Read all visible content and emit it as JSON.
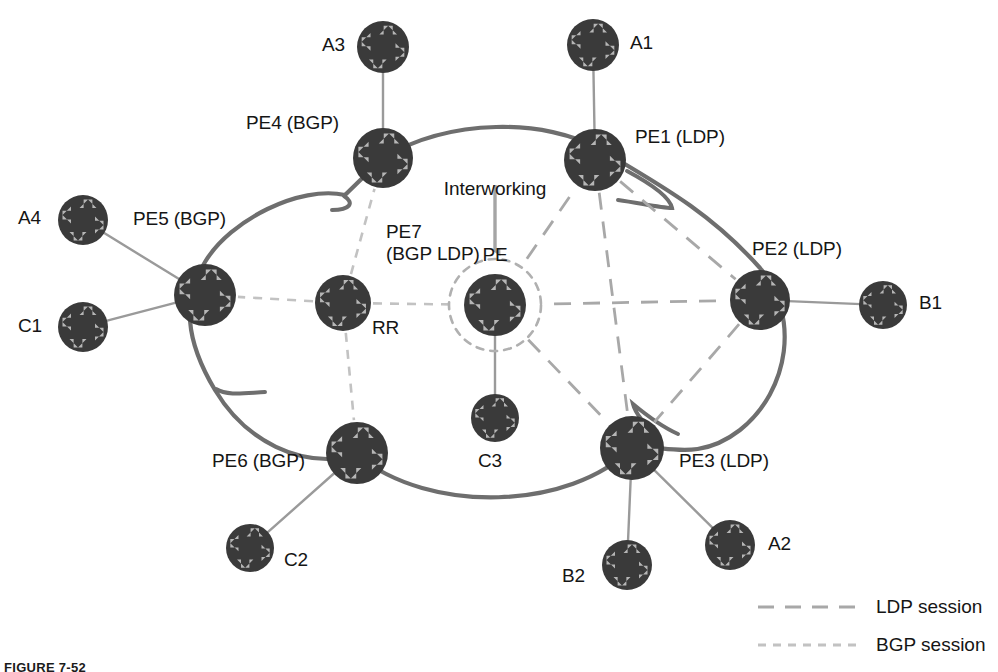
{
  "figure": {
    "type": "network-topology-diagram",
    "caption": "FIGURE 7-52",
    "background_color": "#ffffff",
    "node_fill_color": "#3a3a3a",
    "node_arrow_color": "#b6b6b6",
    "cloud_stroke_color": "#6e6e6e",
    "access_link_color": "#9a9a9a",
    "ldp_session_color": "#a8a8a8",
    "bgp_session_color": "#c2c2c2",
    "interworking_circle_color": "#b0b0b0",
    "arrow_annotation_color": "#a5a5a5"
  },
  "annotation": {
    "interworking_line1": "Interworking",
    "interworking_line2": "PE",
    "arrow_icon": "down-arrow-icon"
  },
  "legend": {
    "items": [
      {
        "id": "ldp",
        "label": "LDP session",
        "style": "long-dash",
        "color": "#a8a8a8"
      },
      {
        "id": "bgp",
        "label": "BGP session",
        "style": "short-dash",
        "color": "#c2c2c2"
      }
    ]
  },
  "nodes": [
    {
      "id": "A3",
      "label": "A3",
      "x": 383,
      "y": 47,
      "r": 26,
      "label_x": 322,
      "label_y": 34,
      "align": "left",
      "role": "ce"
    },
    {
      "id": "A1",
      "label": "A1",
      "x": 593,
      "y": 45,
      "r": 26,
      "label_x": 630,
      "label_y": 32,
      "align": "left",
      "role": "ce"
    },
    {
      "id": "PE4",
      "label": "PE4 (BGP)",
      "x": 383,
      "y": 158,
      "r": 30,
      "label_x": 246,
      "label_y": 112,
      "align": "left",
      "role": "pe-bgp"
    },
    {
      "id": "PE1",
      "label": "PE1 (LDP)",
      "x": 595,
      "y": 160,
      "r": 31,
      "label_x": 635,
      "label_y": 126,
      "align": "left",
      "role": "pe-ldp"
    },
    {
      "id": "A4",
      "label": "A4",
      "x": 83,
      "y": 220,
      "r": 25,
      "label_x": 18,
      "label_y": 207,
      "align": "left",
      "role": "ce"
    },
    {
      "id": "PE5",
      "label": "PE5 (BGP)",
      "x": 205,
      "y": 295,
      "r": 31,
      "label_x": 133,
      "label_y": 208,
      "align": "left",
      "role": "pe-bgp"
    },
    {
      "id": "PE2",
      "label": "PE2 (LDP)",
      "x": 760,
      "y": 300,
      "r": 30,
      "label_x": 752,
      "label_y": 238,
      "align": "left",
      "role": "pe-ldp"
    },
    {
      "id": "B1",
      "label": "B1",
      "x": 883,
      "y": 305,
      "r": 24,
      "label_x": 919,
      "label_y": 292,
      "align": "left",
      "role": "ce"
    },
    {
      "id": "RR",
      "label": "RR",
      "x": 343,
      "y": 303,
      "r": 28,
      "label_x": 372,
      "label_y": 317,
      "align": "left",
      "role": "rr"
    },
    {
      "id": "PE7",
      "label": "PE7\n(BGP LDP)",
      "x": 495,
      "y": 305,
      "r": 31,
      "label_x": 386,
      "label_y": 221,
      "align": "left",
      "role": "pe-interworking"
    },
    {
      "id": "C1",
      "label": "C1",
      "x": 83,
      "y": 327,
      "r": 25,
      "label_x": 18,
      "label_y": 315,
      "align": "left",
      "role": "ce"
    },
    {
      "id": "C3",
      "label": "C3",
      "x": 495,
      "y": 418,
      "r": 24,
      "label_x": 478,
      "label_y": 450,
      "align": "left",
      "role": "ce"
    },
    {
      "id": "PE6",
      "label": "PE6 (BGP)",
      "x": 357,
      "y": 453,
      "r": 31,
      "label_x": 212,
      "label_y": 450,
      "align": "left",
      "role": "pe-bgp"
    },
    {
      "id": "PE3",
      "label": "PE3 (LDP)",
      "x": 632,
      "y": 448,
      "r": 32,
      "label_x": 679,
      "label_y": 450,
      "align": "left",
      "role": "pe-ldp"
    },
    {
      "id": "C2",
      "label": "C2",
      "x": 250,
      "y": 548,
      "r": 24,
      "label_x": 284,
      "label_y": 549,
      "align": "left",
      "role": "ce"
    },
    {
      "id": "B2",
      "label": "B2",
      "x": 627,
      "y": 565,
      "r": 25,
      "label_x": 562,
      "label_y": 565,
      "align": "left",
      "role": "ce"
    },
    {
      "id": "A2",
      "label": "A2",
      "x": 730,
      "y": 545,
      "r": 25,
      "label_x": 768,
      "label_y": 533,
      "align": "left",
      "role": "ce"
    }
  ],
  "access_links": [
    {
      "from": "A3",
      "to": "PE4"
    },
    {
      "from": "A1",
      "to": "PE1"
    },
    {
      "from": "A4",
      "to": "PE5"
    },
    {
      "from": "C1",
      "to": "PE5"
    },
    {
      "from": "PE2",
      "to": "B1"
    },
    {
      "from": "PE7",
      "to": "C3"
    },
    {
      "from": "PE6",
      "to": "C2"
    },
    {
      "from": "PE3",
      "to": "B2"
    },
    {
      "from": "PE3",
      "to": "A2"
    }
  ],
  "ldp_sessions": [
    {
      "from": "PE1",
      "to": "PE2"
    },
    {
      "from": "PE1",
      "to": "PE3"
    },
    {
      "from": "PE1",
      "to": "PE7"
    },
    {
      "from": "PE2",
      "to": "PE3"
    },
    {
      "from": "PE2",
      "to": "PE7"
    },
    {
      "from": "PE3",
      "to": "PE7"
    }
  ],
  "bgp_sessions": [
    {
      "from": "RR",
      "to": "PE4"
    },
    {
      "from": "RR",
      "to": "PE5"
    },
    {
      "from": "RR",
      "to": "PE6"
    },
    {
      "from": "RR",
      "to": "PE7"
    }
  ]
}
